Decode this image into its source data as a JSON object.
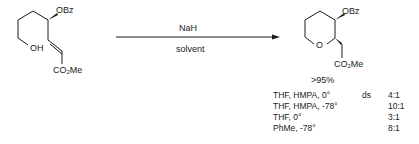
{
  "reactant": {
    "substituent_top": "OBz",
    "substituent_oh": "OH",
    "ester_prefix": "CO",
    "ester_sub": "2",
    "ester_suffix": "Me"
  },
  "arrow": {
    "reagent": "NaH",
    "conditions": "solvent"
  },
  "product": {
    "substituent_top": "OBz",
    "ring_oxygen": "O",
    "ester_prefix": "CO",
    "ester_sub": "2",
    "ester_suffix": "Me",
    "yield": ">95%"
  },
  "table": {
    "ds_label": "ds",
    "rows": [
      {
        "conditions": "THF, HMPA, 0°",
        "ratio": "4:1"
      },
      {
        "conditions": "THF, HMPA, -78°",
        "ratio": "10:1"
      },
      {
        "conditions": "THF, 0°",
        "ratio": "3:1"
      },
      {
        "conditions": "PhMe, -78°",
        "ratio": "8:1"
      }
    ]
  }
}
